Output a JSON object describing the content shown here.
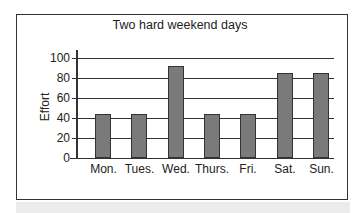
{
  "chart_data": {
    "type": "bar",
    "title": "Two hard weekend days",
    "xlabel": "",
    "ylabel": "Effort",
    "ylim": [
      0,
      100
    ],
    "yticks": [
      0,
      20,
      40,
      60,
      80,
      100
    ],
    "grid": true,
    "categories": [
      "Mon.",
      "Tues.",
      "Wed.",
      "Thurs.",
      "Fri.",
      "Sat.",
      "Sun."
    ],
    "values": [
      44,
      44,
      92,
      44,
      44,
      85,
      85
    ]
  },
  "colors": {
    "bar": "#7a7a7a",
    "border": "#333333"
  }
}
